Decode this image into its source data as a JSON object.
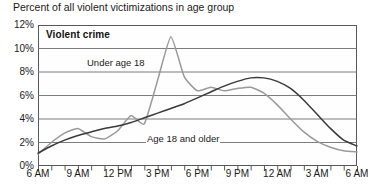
{
  "chart_title": "Percent of all violent victimizations in age group",
  "plot_header": "Violent crime",
  "axis": {
    "y_ticks": [
      "12%",
      "10%",
      "8%",
      "6%",
      "4%",
      "2%",
      "0%"
    ],
    "x_ticks": [
      "6 AM",
      "9 AM",
      "12 PM",
      "3 PM",
      "6 PM",
      "9 PM",
      "12 AM",
      "3 AM",
      "6 AM"
    ]
  },
  "annotations": {
    "under_18": "Under age 18",
    "age_18_older": "Age 18 and older"
  },
  "colors": {
    "under_18_line": "#9a9a9a",
    "age_18_older_line": "#3a3a3a",
    "frame": "#58585a",
    "gridline": "#6e6e70",
    "background": "#ffffff"
  },
  "chart_data": {
    "type": "line",
    "title": "Percent of all violent victimizations in age group",
    "subtitle": "Violent crime",
    "xlabel": "",
    "ylabel": "Percent of all violent victimizations in age group",
    "ylim": [
      0,
      12
    ],
    "ytick_values": [
      0,
      2,
      4,
      6,
      8,
      10,
      12
    ],
    "yunit": "percent",
    "grid": true,
    "legend": "inline-annotations",
    "x": [
      "6 AM",
      "7 AM",
      "8 AM",
      "9 AM",
      "10 AM",
      "11 AM",
      "12 PM",
      "1 PM",
      "2 PM",
      "3 PM",
      "4 PM",
      "5 PM",
      "6 PM",
      "7 PM",
      "8 PM",
      "9 PM",
      "10 PM",
      "11 PM",
      "12 AM",
      "1 AM",
      "2 AM",
      "3 AM",
      "4 AM",
      "5 AM",
      "6 AM"
    ],
    "series": [
      {
        "name": "Under age 18",
        "color": "#9a9a9a",
        "values": [
          1.0,
          2.0,
          2.8,
          3.2,
          2.5,
          2.3,
          3.0,
          4.3,
          3.6,
          7.3,
          11.0,
          7.6,
          6.4,
          6.7,
          6.4,
          6.6,
          6.7,
          6.2,
          5.2,
          4.0,
          2.9,
          2.1,
          1.6,
          1.3,
          1.2
        ]
      },
      {
        "name": "Age 18 and older",
        "color": "#3a3a3a",
        "values": [
          1.1,
          1.7,
          2.2,
          2.6,
          2.9,
          3.2,
          3.4,
          3.7,
          4.1,
          4.5,
          4.9,
          5.3,
          5.8,
          6.3,
          6.8,
          7.2,
          7.5,
          7.5,
          7.2,
          6.6,
          5.6,
          4.4,
          3.2,
          2.2,
          1.7
        ]
      }
    ]
  }
}
